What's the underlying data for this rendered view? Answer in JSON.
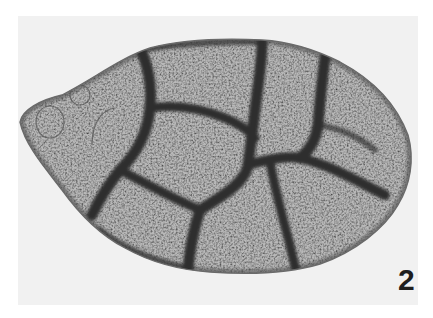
{
  "figure": {
    "panel_label": "2",
    "colors": {
      "background": "#f1f1f1",
      "page": "#ffffff",
      "plate_fill": "#b9b9b9",
      "suture": "#2e2e2e",
      "outline": "#6a6a6a"
    }
  }
}
